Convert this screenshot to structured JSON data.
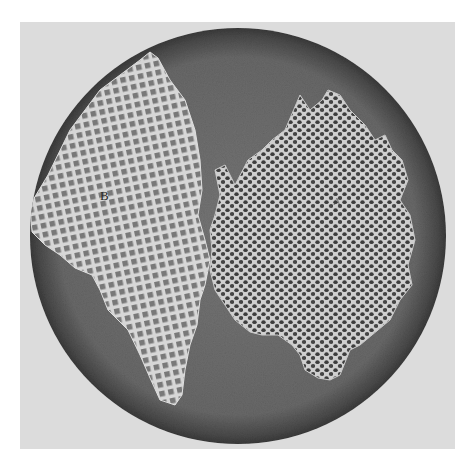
{
  "figure": {
    "labels": {
      "left_fragment": "B",
      "right_fragment": "A"
    },
    "colors": {
      "page": "#ffffff",
      "panel": "#dcdcdc",
      "field": "#6c6c6c",
      "field_rim": "#3e3e3e",
      "mesh_light": "#d9d9d9",
      "pore_dark": "#3a3a3a"
    }
  }
}
